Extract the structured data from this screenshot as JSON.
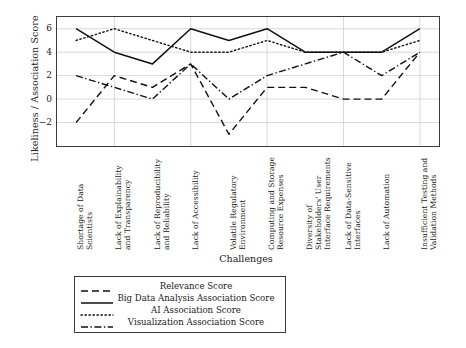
{
  "chart_data": {
    "type": "line",
    "title": "",
    "xlabel": "Challenges",
    "ylabel": "Likeliness / Association Score",
    "ylim": [
      -4,
      7
    ],
    "yticks": [
      6,
      4,
      2,
      0,
      -2
    ],
    "grid": true,
    "legend_position": "below-plot",
    "categories": [
      "Shortage of Data Scientists",
      "Lack of Explainability and Transparency",
      "Lack of Reproducibility and Reliability",
      "Lack of Accessibility",
      "Volatile Regulatory Environment",
      "Computing and Storage Resource Expenses",
      "Diversity of Stakeholders' User Interface Requirements",
      "Lack of Data-Sensitive Interfaces",
      "Lack of Automation",
      "Insufficient Testing and Validation Methods"
    ],
    "series": [
      {
        "name": "Relevance Score",
        "style": "dashed",
        "values": [
          -2,
          2,
          1,
          3,
          -3,
          1,
          1,
          0,
          0,
          4
        ]
      },
      {
        "name": "Big Data Analysis Association Score",
        "style": "solid",
        "values": [
          6,
          4,
          3,
          6,
          5,
          6,
          4,
          4,
          4,
          6
        ]
      },
      {
        "name": "AI Association Score",
        "style": "dotted",
        "values": [
          5,
          6,
          5,
          4,
          4,
          5,
          4,
          4,
          4,
          5
        ]
      },
      {
        "name": "Visualization Association Score",
        "style": "dashdot",
        "values": [
          2,
          1,
          0,
          3,
          0,
          2,
          3,
          4,
          2,
          4
        ]
      }
    ]
  },
  "legend": {
    "entries": [
      {
        "label": "Relevance Score",
        "style": "dashed"
      },
      {
        "label": "Big Data Analysis Association Score",
        "style": "solid"
      },
      {
        "label": "AI Association Score",
        "style": "dotted"
      },
      {
        "label": "Visualization Association Score",
        "style": "dashdot"
      }
    ]
  },
  "axes": {
    "y_title": "Likeliness / Association Score",
    "x_title": "Challenges",
    "y_tick_labels": [
      "6",
      "4",
      "2",
      "0",
      "−2"
    ]
  }
}
